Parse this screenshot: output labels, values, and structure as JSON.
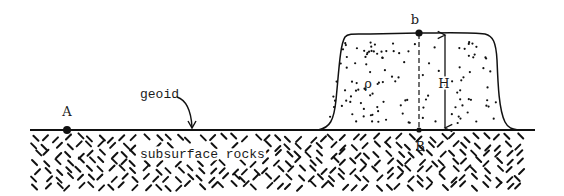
{
  "diagram": {
    "type": "geophysics-cross-section",
    "labels": {
      "point_A": "A",
      "point_b": "b",
      "point_B": "B",
      "height": "H",
      "density": "ρ",
      "geoid": "geoid",
      "subsurface": "subsurface rocks"
    },
    "colors": {
      "line": "#111111",
      "background": "#ffffff"
    }
  }
}
